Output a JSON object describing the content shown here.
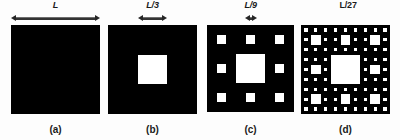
{
  "figure": {
    "background_color": "#fdfdfd",
    "fill_color": "#000000",
    "hole_color": "#ffffff",
    "panel_count": 4
  },
  "panels": [
    {
      "id": "a",
      "caption": "(a)",
      "dimension_label": "L",
      "dimension_label_italic": true,
      "has_arrow": true,
      "iteration": 0,
      "holes_total": 0,
      "arrow_span_fraction": 1.0,
      "x": 11,
      "y": 25,
      "size": 89
    },
    {
      "id": "b",
      "caption": "(b)",
      "dimension_label": "L/3",
      "dimension_label_italic": true,
      "has_arrow": true,
      "iteration": 1,
      "holes_total": 1,
      "arrow_span_fraction": 0.3333,
      "x": 108,
      "y": 25,
      "size": 89
    },
    {
      "id": "c",
      "caption": "(c)",
      "dimension_label": "L/9",
      "dimension_label_italic": true,
      "has_arrow": true,
      "iteration": 2,
      "holes_total": 9,
      "arrow_span_fraction": 0.1111,
      "x": 207,
      "y": 25,
      "size": 87
    },
    {
      "id": "d",
      "caption": "(d)",
      "dimension_label": "L/27",
      "dimension_label_italic": false,
      "has_arrow": false,
      "iteration": 3,
      "holes_total": 73,
      "arrow_span_fraction": 0.037,
      "x": 301,
      "y": 25,
      "size": 89
    }
  ]
}
